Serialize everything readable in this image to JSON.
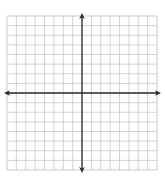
{
  "diagram": {
    "type": "coordinate-plane",
    "grid": {
      "columns": 16,
      "rows": 16,
      "left": 7,
      "top": 16,
      "right": 157,
      "bottom": 170,
      "line_color": "#c8c8c8",
      "border_color": "#bdbdbd"
    },
    "axes": {
      "color": "#2a2a2a",
      "x_axis_row_index": 8,
      "y_axis_col_index": 8,
      "arrowheads": [
        "left",
        "right",
        "up",
        "down"
      ],
      "x_axis_extent": [
        4,
        161
      ],
      "y_axis_extent": [
        13,
        173
      ]
    },
    "labels": []
  }
}
